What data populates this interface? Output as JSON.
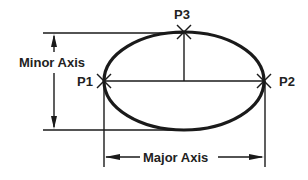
{
  "diagram": {
    "colors": {
      "stroke": "#1a1a1a",
      "text": "#222222",
      "background": "#ffffff"
    },
    "points": [
      {
        "id": "p1",
        "label": "P1"
      },
      {
        "id": "p2",
        "label": "P2"
      },
      {
        "id": "p3",
        "label": "P3"
      }
    ],
    "dimensions": {
      "minor_axis_label": "Minor Axis",
      "major_axis_label": "Major Axis"
    }
  }
}
